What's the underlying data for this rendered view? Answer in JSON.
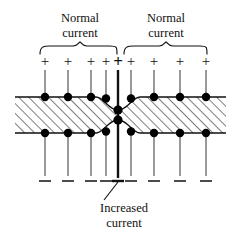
{
  "figure": {
    "title_top_left": {
      "line1": "Normal",
      "line2": "current"
    },
    "title_top_right": {
      "line1": "Normal",
      "line2": "current"
    },
    "title_bottom": {
      "line1": "Increased",
      "line2": "current"
    },
    "plus_sign": "+",
    "minus_sign": "–",
    "center_plus_sign": "+",
    "colors": {
      "ink": "#111111",
      "background": "#ffffff",
      "hatch": "#111111",
      "node": "#000000"
    },
    "electrodes": {
      "count": 9,
      "x_positions": [
        45,
        68,
        91,
        114,
        118,
        141,
        164,
        187,
        210
      ],
      "normal_x": [
        45,
        68,
        91,
        114,
        141,
        164,
        187,
        210
      ],
      "center_x": 118,
      "top_sign_y": 64,
      "bottom_sign_y": 181,
      "lead_top_y": 70,
      "lead_bottom_y": 176
    },
    "band": {
      "x_start": 15,
      "x_end": 226,
      "top_y": 97,
      "bottom_y": 133,
      "neck_top_y": 110,
      "neck_bottom_y": 120,
      "neck_half_width": 22
    },
    "braces": {
      "left": {
        "x_start": 40,
        "x_end": 119,
        "y": 52
      },
      "right": {
        "x_start": 117,
        "x_end": 215,
        "y": 52
      }
    },
    "leader": {
      "x1": 104,
      "y1": 201,
      "x2": 118,
      "y2": 182
    },
    "labels": {
      "left_label_x": 80,
      "left_label_y1": 22,
      "left_label_y2": 37,
      "right_label_x": 166,
      "right_label_y1": 22,
      "right_label_y2": 37,
      "bottom_label_x": 124,
      "bottom_label_y1": 212,
      "bottom_label_y2": 227
    }
  }
}
